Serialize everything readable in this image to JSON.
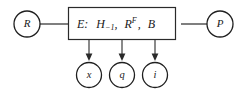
{
  "diagram": {
    "type": "block-diagram",
    "background_color": "#ffffff",
    "stroke_color": "#2a2a2a",
    "text_color": "#1a1a1a",
    "central_block": {
      "label_prefix": "E:",
      "terms": [
        "H",
        "R",
        "B"
      ],
      "full_text": "E: H_{-1}, R^{F}, B",
      "parts": {
        "e_label": "E:",
        "h_base": "H",
        "h_subscript": "−1",
        "comma_1": ",",
        "r_base": "R",
        "r_superscript": "F",
        "comma_2": ",",
        "b_base": "B"
      }
    },
    "left_node": {
      "label": "R",
      "shape": "circle"
    },
    "right_node": {
      "label": "P",
      "shape": "circle"
    },
    "output_nodes": [
      {
        "label": "x",
        "shape": "circle"
      },
      {
        "label": "q",
        "shape": "circle"
      },
      {
        "label": "i",
        "shape": "circle"
      }
    ],
    "connectors": {
      "left_link": "plain-line",
      "right_link": "plain-line",
      "output_links": "down-arrow"
    }
  }
}
